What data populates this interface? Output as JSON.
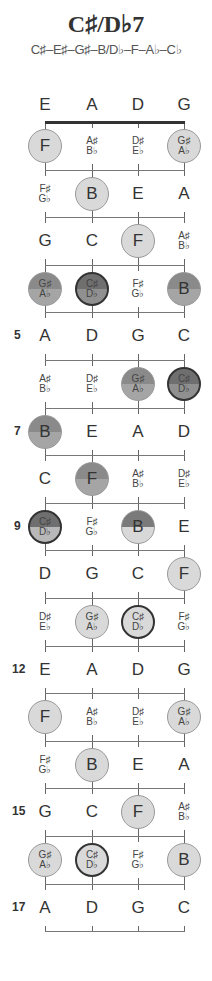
{
  "title": "C♯/D♭7",
  "subtitle": "C♯–E♯–G♯–B/D♭–F–A♭–C♭",
  "strings": [
    "E",
    "A",
    "D",
    "G"
  ],
  "fret_number_labels": [
    {
      "fret": 5,
      "label": "5"
    },
    {
      "fret": 7,
      "label": "7"
    },
    {
      "fret": 9,
      "label": "9"
    },
    {
      "fret": 12,
      "label": "12"
    },
    {
      "fret": 15,
      "label": "15"
    },
    {
      "fret": 17,
      "label": "17"
    }
  ],
  "frets": [
    {
      "fret": 1,
      "cells": [
        {
          "note": [
            "F"
          ],
          "style": "dot light"
        },
        {
          "note": [
            "A♯",
            "B♭"
          ],
          "style": "plain"
        },
        {
          "note": [
            "D♯",
            "E♭"
          ],
          "style": "plain"
        },
        {
          "note": [
            "G♯",
            "A♭"
          ],
          "style": "dot light"
        }
      ]
    },
    {
      "fret": 2,
      "cells": [
        {
          "note": [
            "F♯",
            "G♭"
          ],
          "style": "plain"
        },
        {
          "note": [
            "B"
          ],
          "style": "dot light"
        },
        {
          "note": [
            "E"
          ],
          "style": "plain"
        },
        {
          "note": [
            "A"
          ],
          "style": "plain"
        }
      ]
    },
    {
      "fret": 3,
      "cells": [
        {
          "note": [
            "G"
          ],
          "style": "plain"
        },
        {
          "note": [
            "C"
          ],
          "style": "plain"
        },
        {
          "note": [
            "F"
          ],
          "style": "dot light"
        },
        {
          "note": [
            "A♯",
            "B♭"
          ],
          "style": "plain"
        }
      ]
    },
    {
      "fret": 4,
      "cells": [
        {
          "note": [
            "G♯",
            "A♭"
          ],
          "style": "dot half-dark"
        },
        {
          "note": [
            "C♯",
            "D♭"
          ],
          "style": "dot root-dark"
        },
        {
          "note": [
            "F♯",
            "G♭"
          ],
          "style": "plain"
        },
        {
          "note": [
            "B"
          ],
          "style": "dot half-dark"
        }
      ]
    },
    {
      "fret": 5,
      "cells": [
        {
          "note": [
            "A"
          ],
          "style": "plain"
        },
        {
          "note": [
            "D"
          ],
          "style": "plain"
        },
        {
          "note": [
            "G"
          ],
          "style": "plain"
        },
        {
          "note": [
            "C"
          ],
          "style": "plain"
        }
      ]
    },
    {
      "fret": 6,
      "cells": [
        {
          "note": [
            "A♯",
            "B♭"
          ],
          "style": "plain"
        },
        {
          "note": [
            "D♯",
            "E♭"
          ],
          "style": "plain"
        },
        {
          "note": [
            "G♯",
            "A♭"
          ],
          "style": "dot half-dark"
        },
        {
          "note": [
            "C♯",
            "D♭"
          ],
          "style": "dot root-dark"
        }
      ]
    },
    {
      "fret": 7,
      "cells": [
        {
          "note": [
            "B"
          ],
          "style": "dot half-dark"
        },
        {
          "note": [
            "E"
          ],
          "style": "plain"
        },
        {
          "note": [
            "A"
          ],
          "style": "plain"
        },
        {
          "note": [
            "D"
          ],
          "style": "plain"
        }
      ]
    },
    {
      "fret": 8,
      "cells": [
        {
          "note": [
            "C"
          ],
          "style": "plain"
        },
        {
          "note": [
            "F"
          ],
          "style": "dot half-dark"
        },
        {
          "note": [
            "A♯",
            "B♭"
          ],
          "style": "plain"
        },
        {
          "note": [
            "D♯",
            "E♭"
          ],
          "style": "plain"
        }
      ]
    },
    {
      "fret": 9,
      "cells": [
        {
          "note": [
            "C♯",
            "D♭"
          ],
          "style": "dot root-halfbot"
        },
        {
          "note": [
            "F♯",
            "G♭"
          ],
          "style": "plain"
        },
        {
          "note": [
            "B"
          ],
          "style": "dot half-bot"
        },
        {
          "note": [
            "E"
          ],
          "style": "plain"
        }
      ]
    },
    {
      "fret": 10,
      "cells": [
        {
          "note": [
            "D"
          ],
          "style": "plain"
        },
        {
          "note": [
            "G"
          ],
          "style": "plain"
        },
        {
          "note": [
            "C"
          ],
          "style": "plain"
        },
        {
          "note": [
            "F"
          ],
          "style": "dot light"
        }
      ]
    },
    {
      "fret": 11,
      "cells": [
        {
          "note": [
            "D♯",
            "E♭"
          ],
          "style": "plain"
        },
        {
          "note": [
            "G♯",
            "A♭"
          ],
          "style": "dot light"
        },
        {
          "note": [
            "C♯",
            "D♭"
          ],
          "style": "dot root-light"
        },
        {
          "note": [
            "F♯",
            "G♭"
          ],
          "style": "plain"
        }
      ]
    },
    {
      "fret": 12,
      "cells": [
        {
          "note": [
            "E"
          ],
          "style": "plain"
        },
        {
          "note": [
            "A"
          ],
          "style": "plain"
        },
        {
          "note": [
            "D"
          ],
          "style": "plain"
        },
        {
          "note": [
            "G"
          ],
          "style": "plain"
        }
      ]
    },
    {
      "fret": 13,
      "cells": [
        {
          "note": [
            "F"
          ],
          "style": "dot light"
        },
        {
          "note": [
            "A♯",
            "B♭"
          ],
          "style": "plain"
        },
        {
          "note": [
            "D♯",
            "E♭"
          ],
          "style": "plain"
        },
        {
          "note": [
            "G♯",
            "A♭"
          ],
          "style": "dot light"
        }
      ]
    },
    {
      "fret": 14,
      "cells": [
        {
          "note": [
            "F♯",
            "G♭"
          ],
          "style": "plain"
        },
        {
          "note": [
            "B"
          ],
          "style": "dot light"
        },
        {
          "note": [
            "E"
          ],
          "style": "plain"
        },
        {
          "note": [
            "A"
          ],
          "style": "plain"
        }
      ]
    },
    {
      "fret": 15,
      "cells": [
        {
          "note": [
            "G"
          ],
          "style": "plain"
        },
        {
          "note": [
            "C"
          ],
          "style": "plain"
        },
        {
          "note": [
            "F"
          ],
          "style": "dot light"
        },
        {
          "note": [
            "A♯",
            "B♭"
          ],
          "style": "plain"
        }
      ]
    },
    {
      "fret": 16,
      "cells": [
        {
          "note": [
            "G♯",
            "A♭"
          ],
          "style": "dot light"
        },
        {
          "note": [
            "C♯",
            "D♭"
          ],
          "style": "dot root-light"
        },
        {
          "note": [
            "F♯",
            "G♭"
          ],
          "style": "plain"
        },
        {
          "note": [
            "B"
          ],
          "style": "dot light"
        }
      ]
    },
    {
      "fret": 17,
      "cells": [
        {
          "note": [
            "A"
          ],
          "style": "plain"
        },
        {
          "note": [
            "D"
          ],
          "style": "plain"
        },
        {
          "note": [
            "G"
          ],
          "style": "plain"
        },
        {
          "note": [
            "C"
          ],
          "style": "plain"
        }
      ]
    }
  ],
  "colors": {
    "string_line": "#666666",
    "nut": "#333333",
    "dot_light": "#d9d9d9",
    "dot_dark": "#8a8a8a",
    "root_ring": "#333333"
  }
}
